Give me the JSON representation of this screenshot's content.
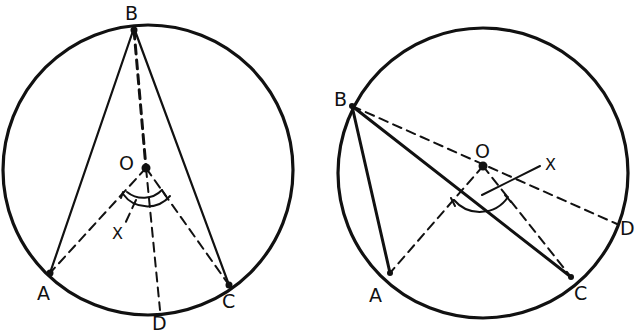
{
  "figures": [
    {
      "id": "left",
      "description": "Inscribed angle ABC with center O inside the angle",
      "circle": {
        "cx": 148,
        "cy": 170,
        "r": 145
      },
      "points": {
        "B": {
          "x": 134,
          "y": 28,
          "label": "B",
          "lx": 126,
          "ly": 20
        },
        "O": {
          "x": 146,
          "y": 168,
          "label": "O",
          "lx": 119,
          "ly": 168
        },
        "A": {
          "x": 50,
          "y": 273,
          "label": "A",
          "lx": 37,
          "ly": 300
        },
        "C": {
          "x": 229,
          "y": 285,
          "label": "C",
          "lx": 223,
          "ly": 308
        },
        "D": {
          "x": 160,
          "y": 310,
          "label": "D",
          "lx": 153,
          "ly": 330
        }
      },
      "x_label": {
        "text": "X",
        "x": 113,
        "y": 238
      }
    },
    {
      "id": "right",
      "description": "Inscribed angle ABC with center O outside the angle",
      "circle": {
        "cx": 483,
        "cy": 173,
        "r": 145
      },
      "points": {
        "B": {
          "x": 352,
          "y": 106,
          "label": "B",
          "lx": 334,
          "ly": 104
        },
        "O": {
          "x": 483,
          "y": 166,
          "label": "O",
          "lx": 475,
          "ly": 156
        },
        "A": {
          "x": 390,
          "y": 273,
          "label": "A",
          "lx": 369,
          "ly": 300
        },
        "C": {
          "x": 571,
          "y": 277,
          "label": "C",
          "lx": 573,
          "ly": 298
        },
        "D": {
          "x": 617,
          "y": 224,
          "label": "D",
          "lx": 620,
          "ly": 235
        }
      },
      "x_label": {
        "text": "X",
        "x": 546,
        "y": 167
      }
    }
  ],
  "labels": {
    "left_B": "B",
    "left_O": "O",
    "left_A": "A",
    "left_C": "C",
    "left_D": "D",
    "left_X": "X",
    "right_B": "B",
    "right_O": "O",
    "right_A": "A",
    "right_C": "C",
    "right_D": "D",
    "right_X": "X"
  }
}
